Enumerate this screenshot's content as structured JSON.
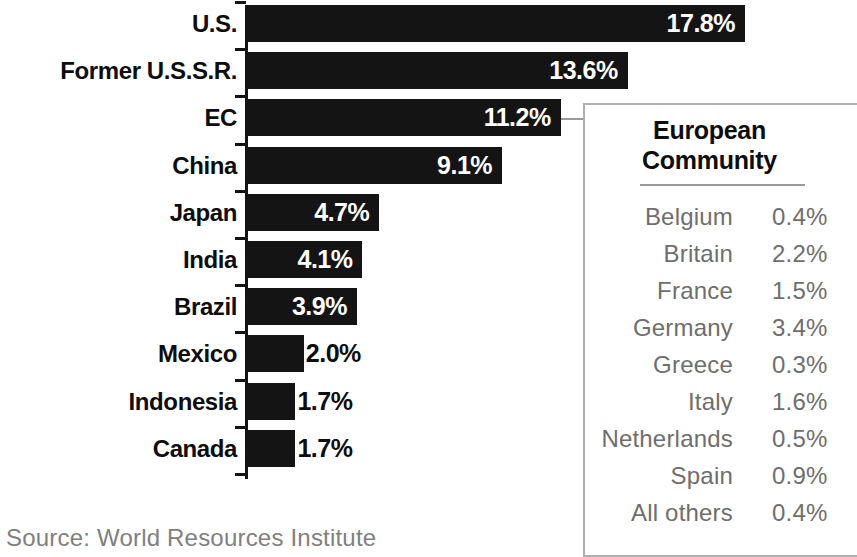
{
  "chart_data": {
    "type": "bar",
    "orientation": "horizontal",
    "title": "",
    "xlabel": "",
    "ylabel": "",
    "xlim": [
      0,
      17.8
    ],
    "grid": false,
    "legend": false,
    "value_suffix": "%",
    "categories": [
      "U.S.",
      "Former U.S.S.R.",
      "EC",
      "China",
      "Japan",
      "India",
      "Brazil",
      "Mexico",
      "Indonesia",
      "Canada"
    ],
    "values": [
      17.8,
      13.6,
      11.2,
      9.1,
      4.7,
      4.1,
      3.9,
      2.0,
      1.7,
      1.7
    ],
    "value_labels": [
      "17.8%",
      "13.6%",
      "11.2%",
      "9.1%",
      "4.7%",
      "4.1%",
      "3.9%",
      "2.0%",
      "1.7%",
      "1.7%"
    ],
    "label_placement": [
      "inside",
      "inside",
      "inside",
      "inside",
      "inside",
      "inside",
      "inside",
      "outside",
      "outside",
      "outside"
    ],
    "bar_color": "#141414",
    "inside_label_color": "#ffffff",
    "outside_label_color": "#0d0d0d",
    "source": "Source: World Resources Institute",
    "callout": {
      "from_category": "EC",
      "title_line1": "European",
      "title_line2": "Community",
      "rows": [
        {
          "name": "Belgium",
          "value": "0.4%"
        },
        {
          "name": "Britain",
          "value": "2.2%"
        },
        {
          "name": "France",
          "value": "1.5%"
        },
        {
          "name": "Germany",
          "value": "3.4%"
        },
        {
          "name": "Greece",
          "value": "0.3%"
        },
        {
          "name": "Italy",
          "value": "1.6%"
        },
        {
          "name": "Netherlands",
          "value": "0.5%"
        },
        {
          "name": "Spain",
          "value": "0.9%"
        },
        {
          "name": "All others",
          "value": "0.4%"
        }
      ],
      "numeric_values": [
        0.4,
        2.2,
        1.5,
        3.4,
        0.3,
        1.6,
        0.5,
        0.9,
        0.4
      ]
    }
  },
  "chart": {
    "bars": [
      {
        "label": "U.S.",
        "value_label": "17.8%"
      },
      {
        "label": "Former U.S.S.R.",
        "value_label": "13.6%"
      },
      {
        "label": "EC",
        "value_label": "11.2%"
      },
      {
        "label": "China",
        "value_label": "9.1%"
      },
      {
        "label": "Japan",
        "value_label": "4.7%"
      },
      {
        "label": "India",
        "value_label": "4.1%"
      },
      {
        "label": "Brazil",
        "value_label": "3.9%"
      },
      {
        "label": "Mexico",
        "value_label": "2.0%"
      },
      {
        "label": "Indonesia",
        "value_label": "1.7%"
      },
      {
        "label": "Canada",
        "value_label": "1.7%"
      }
    ],
    "source": "Source: World Resources Institute"
  },
  "inset": {
    "title_line1": "European",
    "title_line2": "Community",
    "rows": [
      {
        "name": "Belgium",
        "value": "0.4%"
      },
      {
        "name": "Britain",
        "value": "2.2%"
      },
      {
        "name": "France",
        "value": "1.5%"
      },
      {
        "name": "Germany",
        "value": "3.4%"
      },
      {
        "name": "Greece",
        "value": "0.3%"
      },
      {
        "name": "Italy",
        "value": "1.6%"
      },
      {
        "name": "Netherlands",
        "value": "0.5%"
      },
      {
        "name": "Spain",
        "value": "0.9%"
      },
      {
        "name": "All others",
        "value": "0.4%"
      }
    ]
  }
}
